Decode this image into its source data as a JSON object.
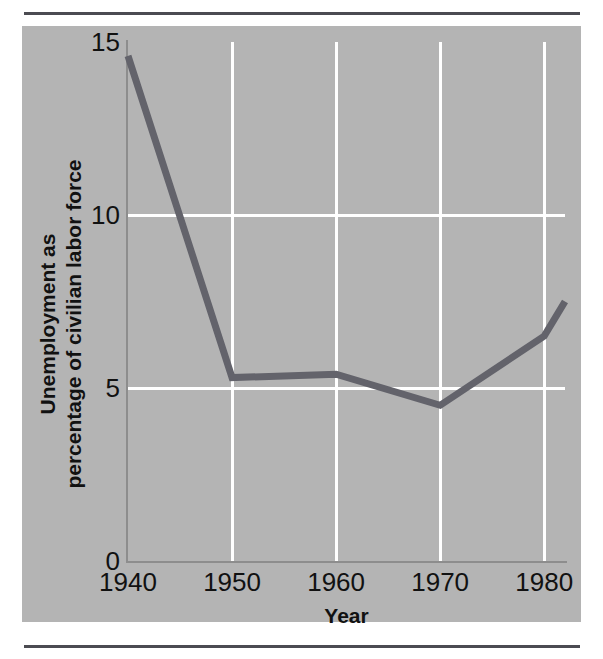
{
  "figure": {
    "panel_color": "#b4b4b4",
    "rule_color": "#4b4b52",
    "gridline_color": "#ffffff",
    "line_color": "#63636b"
  },
  "chart_data": {
    "type": "line",
    "title": "",
    "xlabel": "Year",
    "ylabel": "Unemployment as percentage of civilian labor force",
    "ylabel_line1": "Unemployment as",
    "ylabel_line2": "percentage of civilian labor force",
    "xlim": [
      1940,
      1982
    ],
    "ylim": [
      0,
      15
    ],
    "grid": true,
    "legend": null,
    "xticks": [
      1940,
      1950,
      1960,
      1970,
      1980
    ],
    "xtick_labels": [
      "1940",
      "1950",
      "1960",
      "1970",
      "1980"
    ],
    "yticks": [
      0,
      5,
      10,
      15
    ],
    "ytick_labels": [
      "0",
      "5",
      "10",
      "15"
    ],
    "gridlines_y": [
      5,
      10
    ],
    "gridlines_x": [
      1950,
      1960,
      1970,
      1980
    ],
    "series": [
      {
        "name": "Unemployment rate",
        "color": "#63636b",
        "x": [
          1940,
          1950,
          1960,
          1970,
          1980,
          1982
        ],
        "values": [
          14.6,
          5.3,
          5.4,
          4.5,
          6.5,
          7.5
        ]
      }
    ]
  }
}
